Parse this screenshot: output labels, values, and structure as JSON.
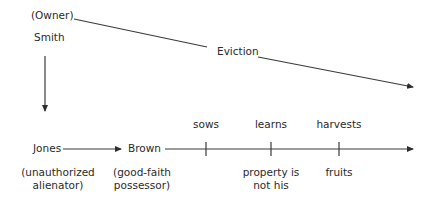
{
  "diagram": {
    "owner_role": "(Owner)",
    "owner_name": "Smith",
    "eviction_label": "Eviction",
    "alienator_name": "Jones",
    "alienator_role_line1": "(unauthorized",
    "alienator_role_line2": "alienator)",
    "possessor_name": "Brown",
    "possessor_role_line1": "(good-faith",
    "possessor_role_line2": "possessor)",
    "timeline_events": [
      {
        "above": "sows",
        "below_line1": "",
        "below_line2": ""
      },
      {
        "above": "learns",
        "below_line1": "property is",
        "below_line2": "not his"
      },
      {
        "above": "harvests",
        "below_line1": "fruits",
        "below_line2": ""
      }
    ]
  },
  "colors": {
    "line": "#3a3a3a",
    "text": "#2a2a2a",
    "background": "#ffffff"
  }
}
